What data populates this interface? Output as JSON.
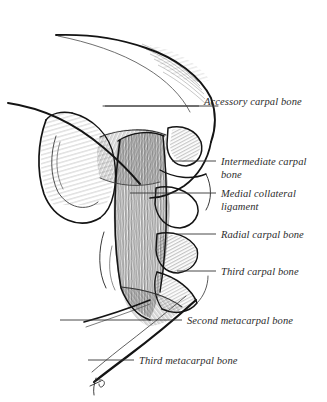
{
  "figure": {
    "background_color": "#ffffff",
    "ink_color": "#1a1a1a",
    "hatch_color": "#3a3a3a",
    "leader_color": "#333333",
    "signature_mark": "JP"
  },
  "labels": [
    {
      "id": "accessory-carpal-bone",
      "text": "Accessory carpal bone",
      "x": 204,
      "y": 95,
      "leader": {
        "x1": 105,
        "y1": 106,
        "x2": 199,
        "y2": 106
      }
    },
    {
      "id": "intermediate-carpal-bone",
      "text": "Intermediate carpal\nbone",
      "x": 221,
      "y": 155,
      "leader": {
        "x1": 172,
        "y1": 161,
        "x2": 216,
        "y2": 161
      }
    },
    {
      "id": "medial-collateral-ligament",
      "text": "Medial collateral\nligament",
      "x": 221,
      "y": 187,
      "leader": {
        "x1": 130,
        "y1": 193,
        "x2": 216,
        "y2": 193
      }
    },
    {
      "id": "radial-carpal-bone",
      "text": "Radial carpal bone",
      "x": 221,
      "y": 228,
      "leader": {
        "x1": 176,
        "y1": 234,
        "x2": 216,
        "y2": 234
      }
    },
    {
      "id": "third-carpal-bone",
      "text": "Third carpal bone",
      "x": 221,
      "y": 265,
      "leader": {
        "x1": 177,
        "y1": 271,
        "x2": 216,
        "y2": 271
      }
    },
    {
      "id": "second-metacarpal-bone",
      "text": "Second metacarpal bone",
      "x": 187,
      "y": 314,
      "leader": {
        "x1": 60,
        "y1": 320,
        "x2": 182,
        "y2": 320
      }
    },
    {
      "id": "third-metacarpal-bone",
      "text": "Third metacarpal bone",
      "x": 139,
      "y": 354,
      "leader": {
        "x1": 88,
        "y1": 360,
        "x2": 134,
        "y2": 360
      }
    }
  ],
  "chart_data": {
    "type": "table",
    "categories": [
      "Accessory carpal bone",
      "Intermediate carpal bone",
      "Medial collateral ligament",
      "Radial carpal bone",
      "Third carpal bone",
      "Second metacarpal bone",
      "Third metacarpal bone"
    ],
    "values": [
      1,
      1,
      1,
      1,
      1,
      1,
      1
    ]
  }
}
